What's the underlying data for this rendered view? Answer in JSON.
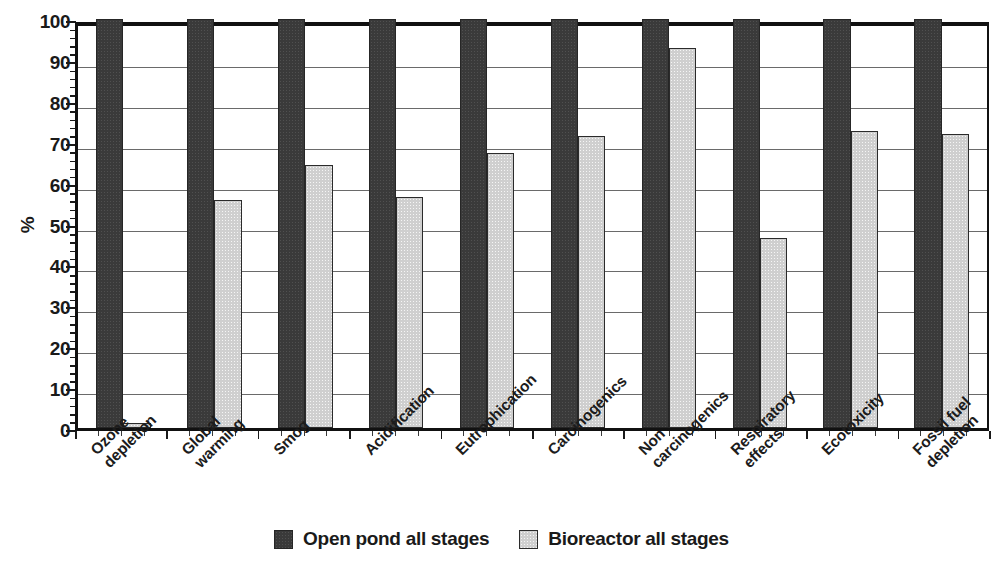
{
  "chart_data": {
    "type": "bar",
    "title": "",
    "xlabel": "",
    "ylabel": "%",
    "ylim": [
      0,
      100
    ],
    "ytick_step": 10,
    "yticks": [
      0,
      10,
      20,
      30,
      40,
      50,
      60,
      70,
      80,
      90,
      100
    ],
    "grid": true,
    "grid_axis": "y",
    "legend_position": "bottom-center",
    "orientation": "vertical",
    "categories": [
      "Ozone\ndepletion",
      "Global\nwarming",
      "Smog",
      "Acidification",
      "Eutrophication",
      "Carcinogenics",
      "Non\ncarcinogenics",
      "Respiratory\neffects",
      "Ecotoxicity",
      "Fossil fuel\ndepletion"
    ],
    "series": [
      {
        "name": "Open pond all stages",
        "color": "#3a3a3a",
        "values": [
          100,
          100,
          100,
          100,
          100,
          100,
          100,
          100,
          100,
          100
        ]
      },
      {
        "name": "Bioreactor all stages",
        "color": "#cfcfcf",
        "values": [
          1.2,
          55.8,
          64.2,
          56.5,
          67.2,
          71.4,
          93.0,
          46.4,
          72.5,
          72.0
        ]
      }
    ]
  },
  "legend": {
    "items": [
      {
        "label": "Open pond all stages",
        "swatch": "dark"
      },
      {
        "label": "Bioreactor all stages",
        "swatch": "light"
      }
    ]
  },
  "axes": {
    "y_title": "%"
  }
}
